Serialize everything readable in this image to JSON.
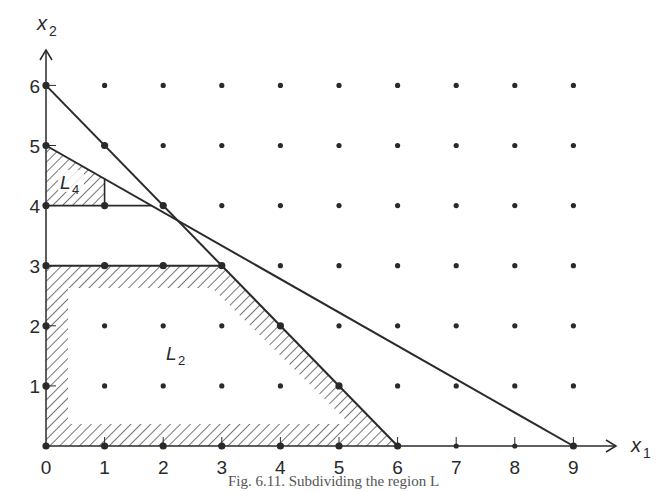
{
  "figure": {
    "caption": "Fig. 6.11. Subdividing the region L",
    "x_axis": {
      "label": "x",
      "label_subscript": "1",
      "ticks": [
        "0",
        "1",
        "2",
        "3",
        "4",
        "5",
        "6",
        "7",
        "8",
        "9"
      ]
    },
    "y_axis": {
      "label": "x",
      "label_subscript": "2",
      "ticks": [
        "1",
        "2",
        "3",
        "4",
        "5",
        "6"
      ]
    },
    "regions": [
      {
        "name": "L",
        "subscript": "4",
        "vertices": [
          [
            0,
            4
          ],
          [
            1,
            4
          ],
          [
            1,
            4.444
          ],
          [
            0,
            5
          ]
        ],
        "fill": "hatched"
      },
      {
        "name": "L",
        "subscript": "2",
        "vertices": [
          [
            0,
            0
          ],
          [
            6,
            0
          ],
          [
            3,
            3
          ],
          [
            0,
            3
          ]
        ],
        "fill": "hatched-border"
      }
    ],
    "lines": [
      {
        "equation": "x1 + x2 = 6",
        "from": [
          0,
          6
        ],
        "to": [
          6,
          0
        ]
      },
      {
        "equation": "5x1 + 9x2 = 45",
        "from": [
          0,
          5
        ],
        "to": [
          9,
          0
        ]
      },
      {
        "equation": "x2 = 4",
        "from": [
          0,
          4
        ],
        "to": [
          1.8,
          4
        ]
      },
      {
        "equation": "x1 = 1",
        "from": [
          1,
          4
        ],
        "to": [
          1,
          4.444
        ]
      },
      {
        "equation": "x2 = 3",
        "from": [
          0,
          3
        ],
        "to": [
          3,
          3
        ]
      }
    ],
    "lattice": {
      "x_range": [
        0,
        10
      ],
      "y_range": [
        0,
        6
      ]
    },
    "colors": {
      "ink": "#2a2a2a",
      "background": "#ffffff"
    }
  }
}
